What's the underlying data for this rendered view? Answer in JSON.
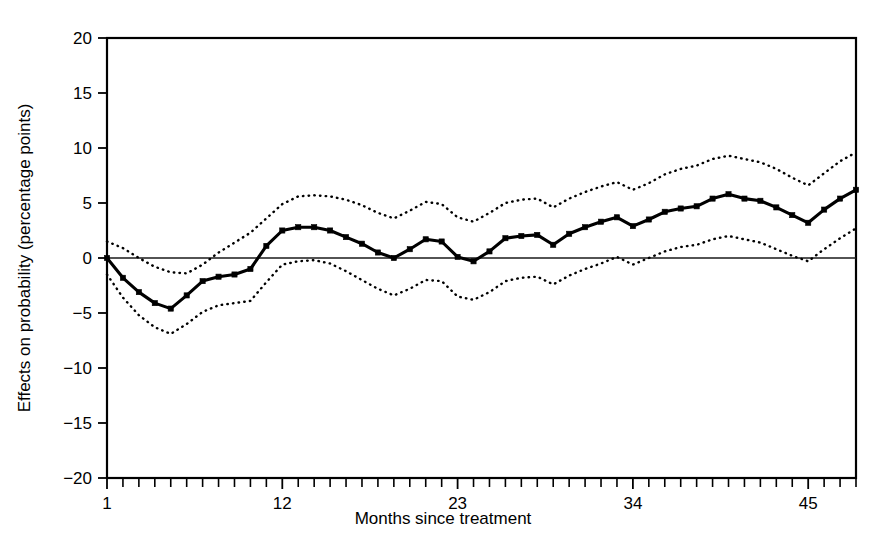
{
  "chart_data": {
    "type": "line",
    "title": "",
    "subtitle": "",
    "xlabel": "Months since treatment",
    "ylabel": "Effects on probability (percentage points)",
    "xlim": [
      1,
      48
    ],
    "ylim": [
      -20,
      20
    ],
    "grid": false,
    "legend": "none",
    "x_tick_labels": [
      "1",
      "12",
      "23",
      "34",
      "45"
    ],
    "x_tick_values": [
      1,
      12,
      23,
      34,
      45
    ],
    "x_minor_tick_step": 1,
    "y_tick_labels": [
      "20",
      "15",
      "10",
      "5",
      "0",
      "-5",
      "-10",
      "-15",
      "-20"
    ],
    "y_tick_values": [
      20,
      15,
      10,
      5,
      0,
      -5,
      -10,
      -15,
      -20
    ],
    "zero_reference_line": 0,
    "x": [
      1,
      2,
      3,
      4,
      5,
      6,
      7,
      8,
      9,
      10,
      11,
      12,
      13,
      14,
      15,
      16,
      17,
      18,
      19,
      20,
      21,
      22,
      23,
      24,
      25,
      26,
      27,
      28,
      29,
      30,
      31,
      32,
      33,
      34,
      35,
      36,
      37,
      38,
      39,
      40,
      41,
      42,
      43,
      44,
      45,
      46,
      47,
      48
    ],
    "series": [
      {
        "name": "Point estimate",
        "style": "solid-with-markers",
        "values": [
          0.0,
          -1.8,
          -3.1,
          -4.1,
          -4.6,
          -3.4,
          -2.1,
          -1.7,
          -1.5,
          -1.0,
          1.1,
          2.5,
          2.8,
          2.8,
          2.5,
          1.9,
          1.3,
          0.5,
          0.0,
          0.8,
          1.7,
          1.5,
          0.1,
          -0.3,
          0.6,
          1.8,
          2.0,
          2.1,
          1.2,
          2.2,
          2.8,
          3.3,
          3.7,
          2.9,
          3.5,
          4.2,
          4.5,
          4.7,
          5.4,
          5.8,
          5.4,
          5.2,
          4.6,
          3.9,
          3.2,
          4.4,
          5.4,
          6.2
        ]
      },
      {
        "name": "Upper 95% confidence bound",
        "style": "dotted",
        "values": [
          1.5,
          0.9,
          0.0,
          -0.8,
          -1.3,
          -1.4,
          -0.6,
          0.5,
          1.4,
          2.3,
          3.6,
          4.9,
          5.6,
          5.7,
          5.6,
          5.3,
          4.8,
          4.1,
          3.6,
          4.3,
          5.1,
          4.9,
          3.7,
          3.3,
          4.1,
          5.0,
          5.3,
          5.4,
          4.6,
          5.4,
          6.0,
          6.5,
          6.9,
          6.2,
          6.8,
          7.6,
          8.1,
          8.4,
          9.0,
          9.3,
          9.0,
          8.7,
          8.1,
          7.3,
          6.6,
          7.7,
          8.8,
          9.6
        ]
      },
      {
        "name": "Lower 95% confidence bound",
        "style": "dotted",
        "values": [
          -1.5,
          -3.6,
          -5.2,
          -6.3,
          -6.9,
          -6.0,
          -4.9,
          -4.3,
          -4.1,
          -3.9,
          -2.2,
          -0.6,
          -0.3,
          -0.2,
          -0.5,
          -1.2,
          -2.0,
          -2.8,
          -3.4,
          -2.8,
          -2.0,
          -2.1,
          -3.5,
          -3.8,
          -3.1,
          -2.1,
          -1.8,
          -1.7,
          -2.4,
          -1.6,
          -1.0,
          -0.5,
          0.1,
          -0.6,
          0.0,
          0.6,
          1.0,
          1.2,
          1.7,
          2.0,
          1.7,
          1.4,
          0.8,
          0.2,
          -0.3,
          0.8,
          1.8,
          2.7
        ]
      }
    ]
  }
}
